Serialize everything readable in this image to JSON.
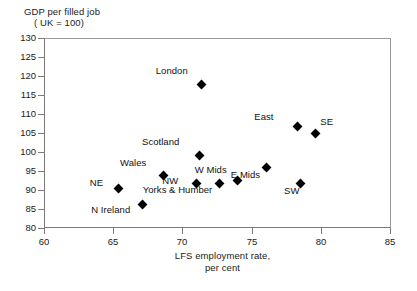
{
  "chart_data": {
    "type": "scatter",
    "title": "",
    "ylabel": "GDP per filled job ( UK = 100)",
    "ylabel_line1": "GDP per filled job",
    "ylabel_line2": "( UK = 100)",
    "xlabel": "LFS employment rate, per cent",
    "xlabel_line1": "LFS employment rate,",
    "xlabel_line2": "per cent",
    "xlim": [
      60,
      85
    ],
    "ylim": [
      80,
      130
    ],
    "xticks": [
      60,
      65,
      70,
      75,
      80,
      85
    ],
    "yticks": [
      80,
      85,
      90,
      95,
      100,
      105,
      110,
      115,
      120,
      125,
      130
    ],
    "grid": false,
    "legend": "none",
    "marker": "diamond",
    "marker_color": "#000000",
    "points": [
      {
        "label": "London",
        "x": 71.4,
        "y": 117.8,
        "label_dx": -20,
        "label_dy": -13
      },
      {
        "label": "Scotland",
        "x": 71.2,
        "y": 99.2,
        "label_dx": -26,
        "label_dy": -13
      },
      {
        "label": "East",
        "x": 78.3,
        "y": 106.7,
        "label_dx": -30,
        "label_dy": -10
      },
      {
        "label": "SE",
        "x": 79.6,
        "y": 104.9,
        "label_dx": 5,
        "label_dy": -11
      },
      {
        "label": "NE",
        "x": 65.4,
        "y": 90.5,
        "label_dx": -22,
        "label_dy": -5
      },
      {
        "label": "N Ireland",
        "x": 67.1,
        "y": 86.2,
        "label_dx": -18,
        "label_dy": 6
      },
      {
        "label": "Wales",
        "x": 68.6,
        "y": 93.7,
        "label_dx": -23,
        "label_dy": -13
      },
      {
        "label": "NW",
        "x": 71.0,
        "y": 91.6,
        "label_dx": -24,
        "label_dy": -3
      },
      {
        "label": "Yorks & Humber",
        "x": 72.7,
        "y": 91.8,
        "label_dx": -13,
        "label_dy": 7
      },
      {
        "label": "W Mids",
        "x": 74.0,
        "y": 92.6,
        "label_dx": -17,
        "label_dy": -10
      },
      {
        "label": "E Mids",
        "x": 76.1,
        "y": 95.8,
        "label_dx": -13,
        "label_dy": 7
      },
      {
        "label": "SW",
        "x": 78.5,
        "y": 91.8,
        "label_dx": -7,
        "label_dy": 8
      }
    ]
  },
  "colors": {
    "marker": "#000000",
    "axis": "#7b7b7b",
    "text": "#1a1a1a",
    "background": "#ffffff"
  }
}
